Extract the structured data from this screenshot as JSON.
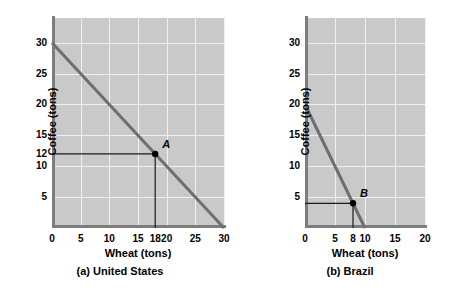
{
  "figure": {
    "background": "#ffffff",
    "plot_background": "#c9c9c9",
    "gridline_color": "#f0f0f0",
    "axis_color": "#7d7d7d",
    "ppf_color": "#6e6e6e",
    "guide_color": "#1a1a1a",
    "point_color": "#000000"
  },
  "chart_data": [
    {
      "type": "line",
      "panel_id": "a",
      "title": "(a) United States",
      "xlabel": "Wheat (tons)",
      "ylabel": "Coffee (tons)",
      "xlim": [
        0,
        30
      ],
      "ylim": [
        0,
        34
      ],
      "grid": true,
      "xticks": [
        0,
        5,
        10,
        15,
        18,
        20,
        25,
        30
      ],
      "xticklabels": [
        "0",
        "5",
        "10",
        "15",
        "18",
        "20",
        "25",
        "30"
      ],
      "yticks": [
        5,
        10,
        12,
        15,
        20,
        25,
        30
      ],
      "yticklabels": [
        "5",
        "10",
        "12",
        "15",
        "20",
        "25",
        "30"
      ],
      "gridx": [
        5,
        10,
        15,
        20,
        25,
        30
      ],
      "gridy": [
        5,
        10,
        15,
        20,
        25,
        30
      ],
      "series": [
        {
          "name": "Production possibilities frontier",
          "x": [
            0,
            30
          ],
          "y": [
            30,
            0
          ]
        }
      ],
      "annotations": [
        {
          "label": "A",
          "x": 18,
          "y": 12,
          "guides": [
            "horizontal",
            "vertical"
          ]
        }
      ]
    },
    {
      "type": "line",
      "panel_id": "b",
      "title": "(b) Brazil",
      "xlabel": "Wheat (tons)",
      "ylabel": "Coffee (tons)",
      "xlim": [
        0,
        20
      ],
      "ylim": [
        0,
        34
      ],
      "grid": true,
      "xticks": [
        0,
        5,
        8,
        10,
        15,
        20
      ],
      "xticklabels": [
        "0",
        "5",
        "8",
        "10",
        "15",
        "20"
      ],
      "yticks": [
        5,
        10,
        15,
        20,
        25,
        30
      ],
      "yticklabels": [
        "5",
        "10",
        "15",
        "20",
        "25",
        "30"
      ],
      "gridx": [
        5,
        10,
        15,
        20
      ],
      "gridy": [
        5,
        10,
        15,
        20,
        25,
        30
      ],
      "series": [
        {
          "name": "Production possibilities frontier",
          "x": [
            0,
            10
          ],
          "y": [
            20,
            0
          ]
        }
      ],
      "annotations": [
        {
          "label": "B",
          "x": 8,
          "y": 4,
          "guides": [
            "horizontal",
            "vertical"
          ]
        }
      ]
    }
  ]
}
